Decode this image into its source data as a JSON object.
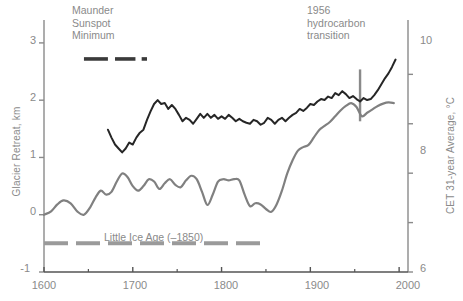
{
  "chart_data": {
    "type": "line",
    "title": "",
    "xlabel": "",
    "ylabel": "Glacier Retreat, km",
    "y2label": "CET 31-year Average, °C",
    "xlim": [
      1600,
      2010
    ],
    "ylim": [
      -1,
      3.4
    ],
    "y2lim": [
      6,
      11.1
    ],
    "grid": false,
    "legend": "none",
    "x_ticks": [
      1600,
      1700,
      1800,
      1900,
      2000
    ],
    "x_tick_labels": [
      "1600",
      "1700",
      "1800",
      "1900",
      "2000"
    ],
    "x_minor_ticks": [
      1650,
      1750,
      1850,
      1950
    ],
    "y_ticks": [
      -1,
      0,
      1,
      2,
      3
    ],
    "y_tick_labels": [
      "-1",
      "0",
      "1",
      "2",
      "3"
    ],
    "y2_ticks": [
      6,
      7,
      8,
      9,
      10
    ],
    "y2_tick_labels": [
      "6",
      "",
      "8",
      "",
      "10"
    ],
    "series": [
      {
        "name": "Glacier Retreat",
        "axis": "left",
        "color": "#808080",
        "units": "km",
        "x": [
          1600,
          1608,
          1615,
          1622,
          1630,
          1638,
          1645,
          1652,
          1658,
          1664,
          1670,
          1676,
          1682,
          1688,
          1694,
          1700,
          1706,
          1712,
          1718,
          1724,
          1730,
          1736,
          1742,
          1748,
          1754,
          1760,
          1766,
          1772,
          1778,
          1784,
          1790,
          1796,
          1802,
          1808,
          1814,
          1820,
          1826,
          1832,
          1838,
          1844,
          1850,
          1856,
          1862,
          1868,
          1874,
          1880,
          1886,
          1892,
          1898,
          1904,
          1910,
          1916,
          1922,
          1928,
          1934,
          1940,
          1946,
          1952,
          1958,
          1964,
          1970,
          1976,
          1982,
          1988,
          1994
        ],
        "y": [
          0.0,
          0.06,
          0.18,
          0.25,
          0.2,
          0.05,
          0.0,
          0.13,
          0.3,
          0.42,
          0.35,
          0.4,
          0.58,
          0.72,
          0.66,
          0.5,
          0.42,
          0.5,
          0.62,
          0.58,
          0.45,
          0.55,
          0.62,
          0.52,
          0.48,
          0.6,
          0.68,
          0.62,
          0.4,
          0.17,
          0.35,
          0.58,
          0.62,
          0.6,
          0.62,
          0.6,
          0.35,
          0.15,
          0.2,
          0.18,
          0.1,
          0.05,
          0.18,
          0.42,
          0.72,
          0.95,
          1.12,
          1.18,
          1.22,
          1.35,
          1.48,
          1.55,
          1.62,
          1.72,
          1.82,
          1.9,
          1.95,
          1.88,
          1.72,
          1.78,
          1.84,
          1.9,
          1.94,
          1.96,
          1.95
        ]
      },
      {
        "name": "CET 31-year Average",
        "axis": "right",
        "color": "#262626",
        "units": "°C",
        "x": [
          1672,
          1676,
          1680,
          1684,
          1688,
          1692,
          1696,
          1700,
          1704,
          1708,
          1712,
          1716,
          1720,
          1724,
          1728,
          1732,
          1736,
          1740,
          1744,
          1748,
          1752,
          1756,
          1760,
          1764,
          1768,
          1772,
          1776,
          1780,
          1784,
          1788,
          1792,
          1796,
          1800,
          1804,
          1808,
          1812,
          1816,
          1820,
          1824,
          1828,
          1832,
          1836,
          1840,
          1844,
          1848,
          1852,
          1856,
          1860,
          1864,
          1868,
          1872,
          1876,
          1880,
          1884,
          1888,
          1892,
          1896,
          1900,
          1904,
          1908,
          1912,
          1916,
          1920,
          1924,
          1928,
          1932,
          1936,
          1940,
          1944,
          1948,
          1952,
          1956,
          1960,
          1964,
          1968,
          1972,
          1976,
          1980,
          1984,
          1988,
          1992,
          1996
        ],
        "y": [
          8.88,
          8.72,
          8.58,
          8.5,
          8.42,
          8.5,
          8.62,
          8.58,
          8.72,
          8.82,
          8.88,
          9.08,
          9.25,
          9.4,
          9.48,
          9.4,
          9.42,
          9.3,
          9.38,
          9.3,
          9.18,
          9.05,
          9.12,
          9.08,
          9.0,
          9.1,
          9.2,
          9.12,
          9.2,
          9.12,
          9.18,
          9.1,
          9.15,
          9.1,
          9.18,
          9.12,
          9.05,
          9.1,
          9.05,
          9.02,
          9.0,
          9.08,
          9.05,
          8.98,
          9.02,
          9.12,
          9.08,
          9.0,
          9.08,
          9.12,
          9.05,
          9.12,
          9.18,
          9.22,
          9.3,
          9.26,
          9.32,
          9.4,
          9.38,
          9.45,
          9.5,
          9.48,
          9.55,
          9.52,
          9.62,
          9.58,
          9.66,
          9.6,
          9.52,
          9.56,
          9.5,
          9.45,
          9.52,
          9.48,
          9.5,
          9.58,
          9.68,
          9.8,
          9.92,
          10.02,
          10.15,
          10.3
        ]
      }
    ],
    "annotations": [
      {
        "name": "maunder-sunspot-minimum",
        "lines": [
          "Maunder",
          "Sunspot",
          "Minimum"
        ],
        "text": "Maunder Sunspot Minimum",
        "color": "#8a8a8a",
        "marker": {
          "type": "dashed-bar",
          "color": "#3a3a3a",
          "y_value": 2.72,
          "segments": [
            [
              1645,
              1672
            ],
            [
              1680,
              1703
            ],
            [
              1710,
              1716
            ]
          ]
        }
      },
      {
        "name": "hydrocarbon-transition",
        "lines": [
          "1956",
          "hydrocarbon",
          "transition"
        ],
        "text": "1956 hydrocarbon transition",
        "color": "#8a8a8a",
        "marker": {
          "type": "vertical-line",
          "color": "#8a8a8a",
          "x_value": 1956,
          "y_span": [
            9.05,
            10.1
          ]
        }
      },
      {
        "name": "little-ice-age",
        "lines": [
          "Little Ice Age (–1850)"
        ],
        "text": "Little Ice Age (–1850)",
        "color": "#9a9a9a",
        "marker": {
          "type": "dashed-bar",
          "color": "#9a9a9a",
          "y_value": -0.5,
          "segments": [
            [
              1600,
              1850
            ]
          ]
        }
      }
    ]
  },
  "axes": {
    "left": {
      "title": "Glacier Retreat, km",
      "tick_labels": [
        "3",
        "2",
        "1",
        "0",
        "-1"
      ],
      "color": "#8a8a8a"
    },
    "right": {
      "title": "CET 31-year Average, °C",
      "tick_labels": [
        "10",
        "8",
        "6"
      ],
      "color": "#8a8a8a"
    },
    "bottom": {
      "tick_labels": [
        "1600",
        "1700",
        "1800",
        "1900",
        "2000"
      ],
      "color": "#555555"
    }
  }
}
